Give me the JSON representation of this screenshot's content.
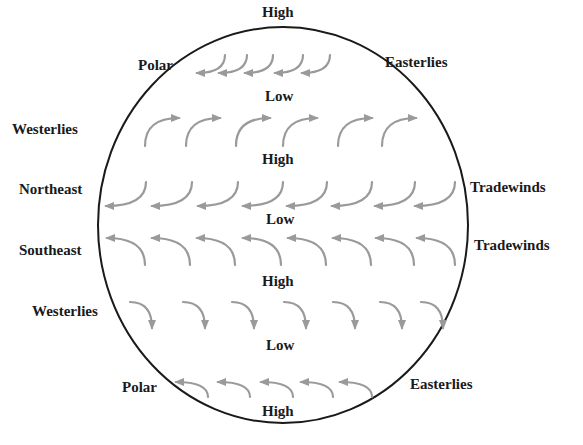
{
  "diagram": {
    "colors": {
      "outline": "#1a1a1a",
      "arrow": "#9a9a9a",
      "text": "#1a1a1a",
      "background": "#ffffff"
    },
    "pressure_labels": [
      {
        "id": "high-north-pole",
        "text": "High",
        "x": 262,
        "y": 5
      },
      {
        "id": "low-60n",
        "text": "Low",
        "x": 265,
        "y": 89
      },
      {
        "id": "high-30n",
        "text": "High",
        "x": 262,
        "y": 152
      },
      {
        "id": "low-equator",
        "text": "Low",
        "x": 266,
        "y": 212
      },
      {
        "id": "high-30s",
        "text": "High",
        "x": 262,
        "y": 274
      },
      {
        "id": "low-60s",
        "text": "Low",
        "x": 266,
        "y": 338
      },
      {
        "id": "high-south-pole",
        "text": "High",
        "x": 262,
        "y": 404
      }
    ],
    "wind_labels": [
      {
        "id": "polar-north-left",
        "text": "Polar",
        "x": 138,
        "y": 58
      },
      {
        "id": "easterlies-north-right",
        "text": "Easterlies",
        "x": 385,
        "y": 55
      },
      {
        "id": "westerlies-north-left",
        "text": "Westerlies",
        "x": 12,
        "y": 122
      },
      {
        "id": "northeast-left",
        "text": "Northeast",
        "x": 19,
        "y": 182
      },
      {
        "id": "tradewinds-north-right",
        "text": "Tradewinds",
        "x": 470,
        "y": 180
      },
      {
        "id": "southeast-left",
        "text": "Southeast",
        "x": 19,
        "y": 243
      },
      {
        "id": "tradewinds-south-right",
        "text": "Tradewinds",
        "x": 474,
        "y": 238
      },
      {
        "id": "westerlies-south-left",
        "text": "Westerlies",
        "x": 32,
        "y": 304
      },
      {
        "id": "polar-south-left",
        "text": "Polar",
        "x": 122,
        "y": 380
      },
      {
        "id": "easterlies-south-right",
        "text": "Easterlies",
        "x": 410,
        "y": 377
      }
    ],
    "globe": {
      "cx": 283,
      "cy": 225,
      "rx": 185,
      "ry": 198
    },
    "arrow_rows": [
      {
        "name": "polar-easterlies-north",
        "direction": "down-then-west",
        "count": 5,
        "starts_x": [
          225,
          247,
          273,
          303,
          330
        ],
        "start_y": 55,
        "dx": -28,
        "dy": 18
      },
      {
        "name": "westerlies-north",
        "direction": "up-then-east",
        "count": 6,
        "starts_x": [
          145,
          186,
          236,
          283,
          338,
          382
        ],
        "start_y": 146,
        "dx": 34,
        "dy": -28
      },
      {
        "name": "northeast-tradewinds",
        "direction": "down-then-west",
        "count": 8,
        "starts_x": [
          146,
          192,
          238,
          283,
          327,
          372,
          415,
          455
        ],
        "start_y": 182,
        "dx": -40,
        "dy": 24
      },
      {
        "name": "southeast-tradewinds",
        "direction": "up-then-west",
        "count": 8,
        "starts_x": [
          145,
          190,
          235,
          281,
          326,
          371,
          414,
          455
        ],
        "start_y": 265,
        "dx": -38,
        "dy": -27
      },
      {
        "name": "westerlies-south",
        "direction": "east-then-down",
        "count": 7,
        "starts_x": [
          130,
          183,
          232,
          284,
          333,
          380,
          421
        ],
        "start_y": 302,
        "dx": 22,
        "dy": 26
      },
      {
        "name": "polar-easterlies-south",
        "direction": "up-then-west",
        "count": 5,
        "starts_x": [
          208,
          250,
          293,
          333,
          372
        ],
        "start_y": 397,
        "dx": -32,
        "dy": -15
      }
    ]
  }
}
